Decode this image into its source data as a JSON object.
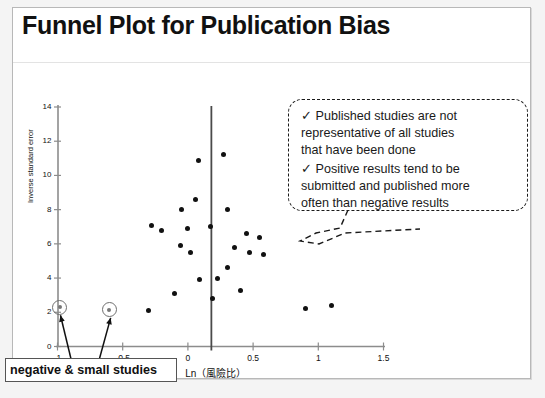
{
  "slide": {
    "title": "Funnel Plot for Publication Bias"
  },
  "callout": {
    "lines": [
      "✓ Published studies are not",
      "representative of all studies",
      "that have been done",
      "✓ Positive results tend to be",
      "submitted and published more",
      "often than negative results"
    ]
  },
  "annotation": {
    "label": "negative & small studies"
  },
  "chart_data": {
    "type": "scatter",
    "title": "Funnel Plot for Publication Bias",
    "xlabel": "Ln（風險比）",
    "ylabel": "Inverse standard error",
    "xlim": [
      -1.15,
      1.6
    ],
    "ylim": [
      0,
      14.5
    ],
    "xticks": [
      -1,
      -0.5,
      0,
      0.5,
      1,
      1.5
    ],
    "xticklabels": [
      "-1",
      "-0.5",
      "0",
      "0.5",
      "1",
      "1.5"
    ],
    "yticks": [
      0,
      2,
      4,
      6,
      8,
      10,
      12,
      14
    ],
    "yticklabels": [
      "0",
      "2",
      "4",
      "6",
      "8",
      "10",
      "12",
      "14"
    ],
    "grid": false,
    "legend": null,
    "reference_line": {
      "type": "vline",
      "x": 0.18,
      "style": "solid",
      "color": "#4a4a4a"
    },
    "points": [
      {
        "x": 0.08,
        "y": 10.9
      },
      {
        "x": 0.27,
        "y": 11.2
      },
      {
        "x": 0.06,
        "y": 8.6
      },
      {
        "x": -0.05,
        "y": 8.0
      },
      {
        "x": 0.3,
        "y": 8.0
      },
      {
        "x": -0.28,
        "y": 7.1
      },
      {
        "x": -0.2,
        "y": 6.8
      },
      {
        "x": 0.0,
        "y": 6.9
      },
      {
        "x": 0.17,
        "y": 7.0
      },
      {
        "x": 0.45,
        "y": 6.6
      },
      {
        "x": 0.55,
        "y": 6.4
      },
      {
        "x": -0.06,
        "y": 5.9
      },
      {
        "x": 0.02,
        "y": 5.5
      },
      {
        "x": 0.36,
        "y": 5.8
      },
      {
        "x": 0.47,
        "y": 5.5
      },
      {
        "x": 0.58,
        "y": 5.4
      },
      {
        "x": 0.3,
        "y": 4.6
      },
      {
        "x": 0.09,
        "y": 3.9
      },
      {
        "x": 0.23,
        "y": 4.0
      },
      {
        "x": 0.4,
        "y": 3.3
      },
      {
        "x": -0.1,
        "y": 3.1
      },
      {
        "x": 0.19,
        "y": 2.8
      },
      {
        "x": -0.3,
        "y": 2.1
      },
      {
        "x": 0.9,
        "y": 2.2
      },
      {
        "x": 1.1,
        "y": 2.4
      }
    ],
    "highlighted_points": [
      {
        "x": -0.99,
        "y": 2.35
      },
      {
        "x": -0.61,
        "y": 2.2
      }
    ],
    "annotations": [
      {
        "text": "negative & small studies",
        "points_to": [
          -0.99,
          2.35
        ]
      },
      {
        "text": "negative & small studies",
        "points_to": [
          -0.61,
          2.2
        ]
      }
    ]
  }
}
